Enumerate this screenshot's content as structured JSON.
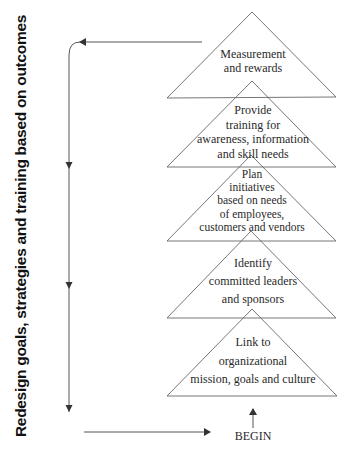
{
  "side_label": "Redesign goals, strategies and training based on outcomes",
  "begin_label": "BEGIN",
  "triangles": [
    {
      "lines": [
        "Measurement",
        "and rewards"
      ]
    },
    {
      "lines": [
        "Provide",
        "training for",
        "awareness, information",
        "and skill needs"
      ]
    },
    {
      "lines": [
        "Plan",
        "initiatives",
        "based on needs",
        "of employees,",
        "customers and vendors"
      ]
    },
    {
      "lines": [
        "Identify",
        "committed leaders",
        "and sponsors"
      ]
    },
    {
      "lines": [
        "Link to",
        "organizational",
        "mission, goals and culture"
      ]
    }
  ],
  "colors": {
    "line": "#555555",
    "text": "#2a2a2a",
    "side_text": "#111111"
  }
}
